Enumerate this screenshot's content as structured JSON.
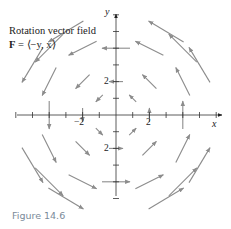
{
  "figure": {
    "title_line1": "Rotation vector field",
    "title_line2_bold": "F",
    "title_line2_rest": " = ⟨−y, x⟩",
    "caption": "Figure 14.6",
    "axis_x_label": "x",
    "axis_y_label": "y",
    "tick_labels": {
      "x_pos": "2",
      "x_neg": "−2",
      "y_pos": "2",
      "y_neg": "−2"
    }
  },
  "colors": {
    "arrow": "#8c8c8c",
    "axis": "#333333",
    "caption": "#7a8a99"
  },
  "chart_data": {
    "type": "vector_field",
    "field": [
      "-y",
      "x"
    ],
    "xlabel": "x",
    "ylabel": "y",
    "xlim": [
      -6,
      6
    ],
    "ylim": [
      -5,
      6
    ],
    "tick_spacing": 1,
    "labeled_ticks": {
      "x": [
        -2,
        2
      ],
      "y": [
        -2,
        2
      ]
    },
    "sample_points": [
      [
        -4,
        4
      ],
      [
        -2,
        4
      ],
      [
        0,
        4
      ],
      [
        2,
        4
      ],
      [
        4,
        4
      ],
      [
        -4,
        2
      ],
      [
        -2,
        2
      ],
      [
        0,
        2
      ],
      [
        2,
        2
      ],
      [
        4,
        2
      ],
      [
        -4,
        0
      ],
      [
        -2,
        0
      ],
      [
        2,
        0
      ],
      [
        4,
        0
      ],
      [
        -4,
        -2
      ],
      [
        -2,
        -2
      ],
      [
        0,
        -2
      ],
      [
        2,
        -2
      ],
      [
        4,
        -2
      ],
      [
        -4,
        -4
      ],
      [
        -2,
        -4
      ],
      [
        0,
        -4
      ],
      [
        2,
        -4
      ],
      [
        4,
        -4
      ],
      [
        -5,
        3
      ],
      [
        5,
        3
      ],
      [
        -5,
        -3
      ],
      [
        5,
        -3
      ],
      [
        -3,
        5
      ],
      [
        3,
        5
      ],
      [
        -3,
        -5
      ],
      [
        3,
        -5
      ],
      [
        -1,
        1
      ],
      [
        1,
        1
      ],
      [
        -1,
        -1
      ],
      [
        1,
        -1
      ]
    ],
    "arrow_scale": 0.42,
    "grid": false
  }
}
